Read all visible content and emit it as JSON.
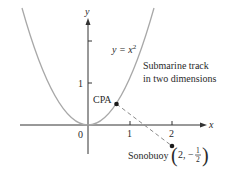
{
  "figure": {
    "curve_label": "y = x",
    "curve_exponent": "2",
    "track_label_line1": "Submarine track",
    "track_label_line2": "in two dimensions",
    "cpa_label": "CPA",
    "sonobuoy_label": "Sonobuoy",
    "sonobuoy_coord_x": "2,",
    "sonobuoy_coord_minus": "−",
    "sonobuoy_coord_num": "1",
    "sonobuoy_coord_den": "2",
    "axes": {
      "x_label": "x",
      "y_label": "y",
      "x_ticks": [
        "0",
        "1",
        "2"
      ],
      "y_ticks": [
        "1"
      ]
    },
    "colors": {
      "curve": "#a8a8a8",
      "axes": "#333333",
      "dashed": "#8a8a8a",
      "points": "#1a1a1a"
    }
  }
}
